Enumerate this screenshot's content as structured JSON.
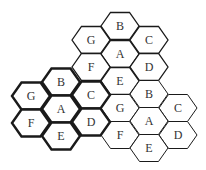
{
  "diagram": {
    "type": "hexagonal cell reuse pattern",
    "hex": {
      "width": 38,
      "height": 27
    },
    "colors": {
      "stroke": "#1a1a1a",
      "fill": "#ffffff",
      "text": "#333333"
    },
    "clusters": [
      {
        "name": "upper-cluster",
        "stroke_width": 1.3,
        "cells": [
          {
            "label": "B",
            "cx": 120,
            "cy": 26
          },
          {
            "label": "G",
            "cx": 91,
            "cy": 40
          },
          {
            "label": "C",
            "cx": 149,
            "cy": 40
          },
          {
            "label": "A",
            "cx": 120,
            "cy": 54
          },
          {
            "label": "F",
            "cx": 91,
            "cy": 67
          },
          {
            "label": "D",
            "cx": 149,
            "cy": 67
          },
          {
            "label": "E",
            "cx": 120,
            "cy": 81
          }
        ]
      },
      {
        "name": "right-cluster",
        "stroke_width": 1.0,
        "cells": [
          {
            "label": "B",
            "cx": 149,
            "cy": 94
          },
          {
            "label": "G",
            "cx": 120,
            "cy": 108
          },
          {
            "label": "C",
            "cx": 178,
            "cy": 108
          },
          {
            "label": "A",
            "cx": 149,
            "cy": 121
          },
          {
            "label": "F",
            "cx": 120,
            "cy": 135
          },
          {
            "label": "D",
            "cx": 178,
            "cy": 135
          },
          {
            "label": "E",
            "cx": 149,
            "cy": 148
          }
        ]
      },
      {
        "name": "left-cluster",
        "stroke_width": 2.4,
        "cells": [
          {
            "label": "B",
            "cx": 61,
            "cy": 82
          },
          {
            "label": "G",
            "cx": 31,
            "cy": 96
          },
          {
            "label": "C",
            "cx": 91,
            "cy": 95
          },
          {
            "label": "A",
            "cx": 61,
            "cy": 109
          },
          {
            "label": "F",
            "cx": 31,
            "cy": 123
          },
          {
            "label": "D",
            "cx": 91,
            "cy": 122
          },
          {
            "label": "E",
            "cx": 61,
            "cy": 136
          }
        ]
      }
    ]
  }
}
